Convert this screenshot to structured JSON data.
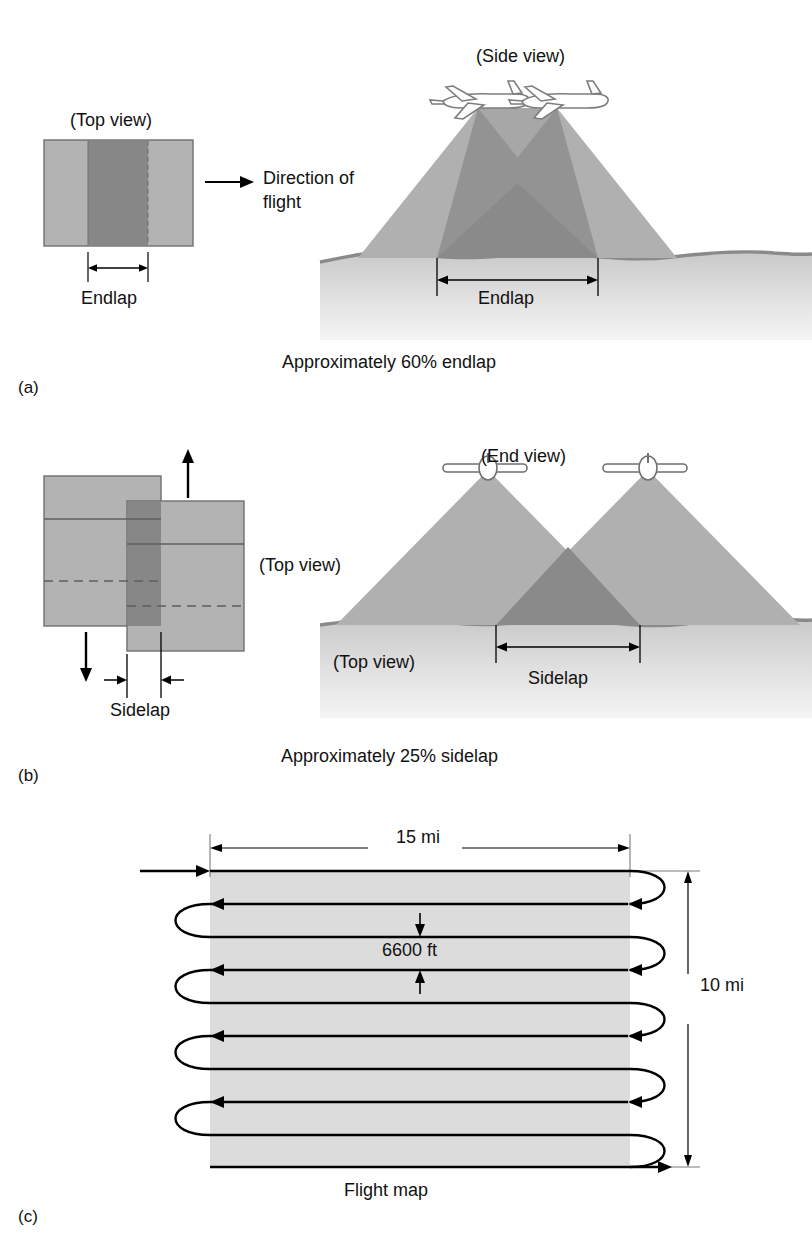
{
  "figure": {
    "colors": {
      "photo_light": "#b3b3b3",
      "photo_overlap": "#878787",
      "photo_border": "#6f6f6f",
      "cone_light": "#b0b0b0",
      "cone_overlap": "#8a8a8a",
      "ground_line": "#8a8a8a",
      "ground_fill_top": "#c9c9c9",
      "ground_fill_bottom": "#f2f2f2",
      "flight_strip": "#dcdcdc",
      "line": "#000000"
    }
  },
  "panels": [
    {
      "id": "a",
      "letter": "(a)",
      "top_view_label": "(Top view)",
      "side_view_label": "(Side view)",
      "direction_label_line1": "Direction of",
      "direction_label_line2": "flight",
      "endlap_label_top": "Endlap",
      "endlap_label_side": "Endlap",
      "caption": "Approximately 60% endlap",
      "overlap_percent": 60,
      "overlap_type": "endlap",
      "aircraft_count": 2,
      "aircraft_view": "side-profile"
    },
    {
      "id": "b",
      "letter": "(b)",
      "top_view_label": "(Top view)",
      "end_view_label": "(End view)",
      "ground_top_view_label": "(Top view)",
      "sidelap_label_left": "Sidelap",
      "sidelap_label_right": "Sidelap",
      "caption": "Approximately 25% sidelap",
      "overlap_percent": 25,
      "overlap_type": "sidelap",
      "aircraft_count": 2,
      "aircraft_view": "front-profile"
    },
    {
      "id": "c",
      "letter": "(c)",
      "caption": "Flight map",
      "width_label": "15 mi",
      "height_label": "10 mi",
      "spacing_label": "6600 ft",
      "flight_lines": 10,
      "turn_loops_left": 4,
      "turn_loops_right": 5
    }
  ]
}
